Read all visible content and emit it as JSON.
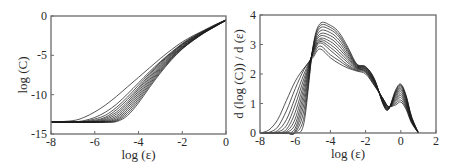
{
  "chart_data": [
    {
      "id": "left",
      "type": "line",
      "title": "",
      "xlabel": "log (ε)",
      "ylabel": "log (C)",
      "xlim": [
        -8,
        0
      ],
      "ylim": [
        -15,
        0
      ],
      "xticks": [
        -8,
        -6,
        -4,
        -2,
        0
      ],
      "yticks": [
        0,
        -5,
        -10,
        -15
      ],
      "grid": false,
      "legend": null,
      "frame_px": {
        "x0": 51,
        "y0": 16,
        "x1": 226,
        "y1": 134
      },
      "series_count": 12,
      "description": "Family of correlation-integral curves; each starts at a plateau near log(C)≈-13.5 for small ε, rises roughly linearly between log(ε)≈-6 and -2, and saturates towards ≈-0.5 at log(ε)=0.",
      "series": [
        {
          "name": "curve 1",
          "x": [
            -8,
            -7,
            -6.5,
            -6,
            -5.5,
            -5,
            -4.5,
            -4,
            -3.5,
            -3,
            -2.5,
            -2,
            -1.5,
            -1,
            -0.5,
            0
          ],
          "y": [
            -13.5,
            -13.3,
            -12.9,
            -12.2,
            -11.3,
            -10.2,
            -9.0,
            -7.8,
            -6.6,
            -5.4,
            -4.3,
            -3.3,
            -2.5,
            -1.8,
            -1.1,
            -0.5
          ]
        },
        {
          "name": "curve 2",
          "x": [
            -8,
            -7,
            -6.5,
            -6,
            -5.5,
            -5,
            -4.5,
            -4,
            -3.5,
            -3,
            -2.5,
            -2,
            -1.5,
            -1,
            -0.5,
            0
          ],
          "y": [
            -13.5,
            -13.45,
            -13.3,
            -12.9,
            -12.2,
            -11.2,
            -9.9,
            -8.5,
            -7.1,
            -5.8,
            -4.6,
            -3.5,
            -2.6,
            -1.9,
            -1.2,
            -0.5
          ]
        },
        {
          "name": "curve 3",
          "x": [
            -8,
            -7,
            -6.5,
            -6,
            -5.5,
            -5,
            -4.5,
            -4,
            -3.5,
            -3,
            -2.5,
            -2,
            -1.5,
            -1,
            -0.5,
            0
          ],
          "y": [
            -13.5,
            -13.5,
            -13.4,
            -13.1,
            -12.6,
            -11.6,
            -10.3,
            -8.8,
            -7.3,
            -5.9,
            -4.7,
            -3.6,
            -2.7,
            -1.9,
            -1.2,
            -0.5
          ]
        },
        {
          "name": "curve 4",
          "x": [
            -8,
            -7,
            -6.5,
            -6,
            -5.5,
            -5,
            -4.5,
            -4,
            -3.5,
            -3,
            -2.5,
            -2,
            -1.5,
            -1,
            -0.5,
            0
          ],
          "y": [
            -13.5,
            -13.5,
            -13.45,
            -13.25,
            -12.85,
            -11.9,
            -10.6,
            -9.1,
            -7.5,
            -6.0,
            -4.8,
            -3.6,
            -2.7,
            -1.9,
            -1.2,
            -0.5
          ]
        },
        {
          "name": "curve 5",
          "x": [
            -8,
            -7,
            -6.5,
            -6,
            -5.5,
            -5,
            -4.5,
            -4,
            -3.5,
            -3,
            -2.5,
            -2,
            -1.5,
            -1,
            -0.5,
            0
          ],
          "y": [
            -13.5,
            -13.5,
            -13.5,
            -13.35,
            -13.0,
            -12.2,
            -10.9,
            -9.3,
            -7.7,
            -6.2,
            -4.9,
            -3.7,
            -2.8,
            -2.0,
            -1.2,
            -0.5
          ]
        },
        {
          "name": "curve 6",
          "x": [
            -8,
            -7,
            -6.5,
            -6,
            -5.5,
            -5,
            -4.5,
            -4,
            -3.5,
            -3,
            -2.5,
            -2,
            -1.5,
            -1,
            -0.5,
            0
          ],
          "y": [
            -13.5,
            -13.5,
            -13.5,
            -13.42,
            -13.15,
            -12.45,
            -11.15,
            -9.55,
            -7.9,
            -6.35,
            -5.0,
            -3.8,
            -2.85,
            -2.0,
            -1.25,
            -0.5
          ]
        },
        {
          "name": "curve 7",
          "x": [
            -8,
            -7,
            -6.5,
            -6,
            -5.5,
            -5,
            -4.5,
            -4,
            -3.5,
            -3,
            -2.5,
            -2,
            -1.5,
            -1,
            -0.5,
            0
          ],
          "y": [
            -13.5,
            -13.5,
            -13.5,
            -13.47,
            -13.27,
            -12.7,
            -11.4,
            -9.8,
            -8.1,
            -6.5,
            -5.1,
            -3.9,
            -2.9,
            -2.05,
            -1.25,
            -0.5
          ]
        },
        {
          "name": "curve 8",
          "x": [
            -8,
            -7,
            -6.5,
            -6,
            -5.5,
            -5,
            -4.5,
            -4,
            -3.5,
            -3,
            -2.5,
            -2,
            -1.5,
            -1,
            -0.5,
            0
          ],
          "y": [
            -13.5,
            -13.5,
            -13.5,
            -13.5,
            -13.37,
            -12.9,
            -11.65,
            -10.05,
            -8.3,
            -6.65,
            -5.2,
            -3.95,
            -2.95,
            -2.05,
            -1.3,
            -0.55
          ]
        },
        {
          "name": "curve 9",
          "x": [
            -8,
            -7,
            -6.5,
            -6,
            -5.5,
            -5,
            -4.5,
            -4,
            -3.5,
            -3,
            -2.5,
            -2,
            -1.5,
            -1,
            -0.5,
            0
          ],
          "y": [
            -13.5,
            -13.5,
            -13.5,
            -13.5,
            -13.43,
            -13.08,
            -11.9,
            -10.3,
            -8.5,
            -6.8,
            -5.3,
            -4.0,
            -3.0,
            -2.1,
            -1.3,
            -0.55
          ]
        },
        {
          "name": "curve 10",
          "x": [
            -8,
            -7,
            -6.5,
            -6,
            -5.5,
            -5,
            -4.5,
            -4,
            -3.5,
            -3,
            -2.5,
            -2,
            -1.5,
            -1,
            -0.5,
            0
          ],
          "y": [
            -13.5,
            -13.5,
            -13.5,
            -13.5,
            -13.47,
            -13.22,
            -12.15,
            -10.55,
            -8.7,
            -6.95,
            -5.4,
            -4.1,
            -3.05,
            -2.1,
            -1.3,
            -0.55
          ]
        },
        {
          "name": "curve 11",
          "x": [
            -8,
            -7,
            -6.5,
            -6,
            -5.5,
            -5,
            -4.5,
            -4,
            -3.5,
            -3,
            -2.5,
            -2,
            -1.5,
            -1,
            -0.5,
            0
          ],
          "y": [
            -13.5,
            -13.5,
            -13.5,
            -13.5,
            -13.5,
            -13.33,
            -12.4,
            -10.8,
            -8.9,
            -7.1,
            -5.5,
            -4.15,
            -3.1,
            -2.15,
            -1.35,
            -0.55
          ]
        },
        {
          "name": "curve 12",
          "x": [
            -8,
            -7,
            -6.5,
            -6,
            -5.5,
            -5,
            -4.5,
            -4,
            -3.5,
            -3,
            -2.5,
            -2,
            -1.5,
            -1,
            -0.5,
            0
          ],
          "y": [
            -13.5,
            -13.5,
            -13.5,
            -13.5,
            -13.5,
            -13.42,
            -12.65,
            -11.05,
            -9.1,
            -7.25,
            -5.6,
            -4.2,
            -3.1,
            -2.15,
            -1.35,
            -0.55
          ]
        }
      ]
    },
    {
      "id": "right",
      "type": "line",
      "title": "",
      "xlabel": "log (ε)",
      "ylabel": "d (log (C)) / d (ε)",
      "xlim": [
        -8,
        2
      ],
      "ylim": [
        0,
        4
      ],
      "xticks": [
        -8,
        -6,
        -4,
        -2,
        0,
        2
      ],
      "yticks": [
        0,
        1,
        2,
        3,
        4
      ],
      "grid": false,
      "legend": null,
      "frame_px": {
        "x0": 260,
        "y0": 15,
        "x1": 436,
        "y1": 133
      },
      "series_count": 12,
      "description": "Local slopes of the left curves: onset between log(ε)≈-7.5 and -5.8, main peak of ≈2.9–3.7 near log(ε)≈-4.6, shoulder ≈2.0–2.25 near -2, dip ≈0.8–0.95 near -0.7, secondary peak ≈1.05–1.65 near 0, falling to 0 by ≈1.",
      "series": [
        {
          "name": "curve 1",
          "x": [
            -8,
            -7.5,
            -7,
            -6.5,
            -6,
            -5.5,
            -5,
            -4.6,
            -4,
            -3.5,
            -3,
            -2.5,
            -2,
            -1.5,
            -1,
            -0.7,
            -0.3,
            0,
            0.3,
            0.6,
            1.0
          ],
          "y": [
            0,
            0.1,
            0.45,
            1.1,
            1.75,
            2.2,
            2.55,
            2.85,
            2.55,
            2.35,
            2.2,
            2.1,
            2.0,
            1.6,
            1.15,
            0.9,
            0.95,
            1.05,
            0.8,
            0.35,
            0
          ]
        },
        {
          "name": "curve 2",
          "x": [
            -8,
            -7.5,
            -7,
            -6.5,
            -6,
            -5.5,
            -5,
            -4.6,
            -4,
            -3.5,
            -3,
            -2.5,
            -2,
            -1.5,
            -1,
            -0.7,
            -0.3,
            0,
            0.3,
            0.6,
            1.0
          ],
          "y": [
            0,
            0.02,
            0.2,
            0.75,
            1.5,
            2.15,
            2.6,
            2.95,
            2.65,
            2.45,
            2.25,
            2.12,
            2.05,
            1.62,
            1.15,
            0.9,
            1.0,
            1.12,
            0.85,
            0.38,
            0
          ]
        },
        {
          "name": "curve 3",
          "x": [
            -8,
            -7.5,
            -7,
            -6.5,
            -6,
            -5.5,
            -5,
            -4.6,
            -4,
            -3.5,
            -3,
            -2.5,
            -2,
            -1.5,
            -1,
            -0.7,
            -0.3,
            0,
            0.3,
            0.6,
            1.0
          ],
          "y": [
            0,
            0,
            0.08,
            0.45,
            1.2,
            2.0,
            2.65,
            3.05,
            2.8,
            2.55,
            2.3,
            2.15,
            2.08,
            1.65,
            1.15,
            0.88,
            1.05,
            1.2,
            0.9,
            0.4,
            0
          ]
        },
        {
          "name": "curve 4",
          "x": [
            -8,
            -7.5,
            -7,
            -6.5,
            -6,
            -5.5,
            -5,
            -4.6,
            -4,
            -3.5,
            -3,
            -2.5,
            -2,
            -1.5,
            -1,
            -0.7,
            -0.3,
            0,
            0.3,
            0.6,
            1.0
          ],
          "y": [
            0,
            0,
            0.03,
            0.25,
            0.95,
            1.85,
            2.7,
            3.1,
            2.9,
            2.65,
            2.38,
            2.18,
            2.1,
            1.68,
            1.12,
            0.87,
            1.1,
            1.27,
            0.95,
            0.42,
            0
          ]
        },
        {
          "name": "curve 5",
          "x": [
            -8,
            -7.5,
            -7,
            -6.5,
            -6,
            -5.5,
            -5,
            -4.6,
            -4,
            -3.5,
            -3,
            -2.5,
            -2,
            -1.5,
            -1,
            -0.7,
            -0.3,
            0,
            0.3,
            0.6,
            1.0
          ],
          "y": [
            0,
            0,
            0,
            0.12,
            0.7,
            1.7,
            2.72,
            3.15,
            3.0,
            2.75,
            2.45,
            2.2,
            2.12,
            1.7,
            1.1,
            0.86,
            1.15,
            1.33,
            1.0,
            0.44,
            0
          ]
        },
        {
          "name": "curve 6",
          "x": [
            -8,
            -7.5,
            -7,
            -6.5,
            -6,
            -5.5,
            -5,
            -4.6,
            -4,
            -3.5,
            -3,
            -2.5,
            -2,
            -1.5,
            -1,
            -0.7,
            -0.3,
            0,
            0.3,
            0.6,
            1.0
          ],
          "y": [
            0,
            0,
            0,
            0.05,
            0.48,
            1.55,
            2.75,
            3.2,
            3.1,
            2.85,
            2.52,
            2.22,
            2.15,
            1.72,
            1.08,
            0.85,
            1.2,
            1.4,
            1.05,
            0.46,
            0
          ]
        },
        {
          "name": "curve 7",
          "x": [
            -8,
            -7.5,
            -7,
            -6.5,
            -6,
            -5.5,
            -5,
            -4.6,
            -4,
            -3.5,
            -3,
            -2.5,
            -2,
            -1.5,
            -1,
            -0.7,
            -0.3,
            0,
            0.3,
            0.6,
            1.0
          ],
          "y": [
            0,
            0,
            0,
            0.02,
            0.3,
            1.38,
            2.78,
            3.28,
            3.2,
            2.95,
            2.58,
            2.24,
            2.17,
            1.74,
            1.06,
            0.84,
            1.25,
            1.46,
            1.1,
            0.48,
            0
          ]
        },
        {
          "name": "curve 8",
          "x": [
            -8,
            -7.5,
            -7,
            -6.5,
            -6,
            -5.5,
            -5,
            -4.6,
            -4,
            -3.5,
            -3,
            -2.5,
            -2,
            -1.5,
            -1,
            -0.7,
            -0.3,
            0,
            0.3,
            0.6,
            1.0
          ],
          "y": [
            0,
            0,
            0,
            0,
            0.16,
            1.2,
            2.8,
            3.35,
            3.3,
            3.05,
            2.65,
            2.26,
            2.19,
            1.76,
            1.04,
            0.83,
            1.3,
            1.51,
            1.14,
            0.5,
            0
          ]
        },
        {
          "name": "curve 9",
          "x": [
            -8,
            -7.5,
            -7,
            -6.5,
            -6,
            -5.5,
            -5,
            -4.6,
            -4,
            -3.5,
            -3,
            -2.5,
            -2,
            -1.5,
            -1,
            -0.7,
            -0.3,
            0,
            0.3,
            0.6,
            1.0
          ],
          "y": [
            0,
            0,
            0,
            0,
            0.07,
            1.0,
            2.82,
            3.45,
            3.4,
            3.15,
            2.72,
            2.28,
            2.21,
            1.78,
            1.02,
            0.82,
            1.34,
            1.56,
            1.18,
            0.52,
            0
          ]
        },
        {
          "name": "curve 10",
          "x": [
            -8,
            -7.5,
            -7,
            -6.5,
            -6,
            -5.5,
            -5,
            -4.6,
            -4,
            -3.5,
            -3,
            -2.5,
            -2,
            -1.5,
            -1,
            -0.7,
            -0.3,
            0,
            0.3,
            0.6,
            1.0
          ],
          "y": [
            0,
            0,
            0,
            0,
            0.02,
            0.78,
            2.84,
            3.55,
            3.5,
            3.25,
            2.78,
            2.3,
            2.23,
            1.8,
            1.0,
            0.81,
            1.38,
            1.6,
            1.22,
            0.54,
            0
          ]
        },
        {
          "name": "curve 11",
          "x": [
            -8,
            -7.5,
            -7,
            -6.5,
            -6,
            -5.5,
            -5,
            -4.6,
            -4,
            -3.5,
            -3,
            -2.5,
            -2,
            -1.5,
            -1,
            -0.7,
            -0.3,
            0,
            0.3,
            0.6,
            1.0
          ],
          "y": [
            0,
            0,
            0,
            0,
            0,
            0.55,
            2.86,
            3.63,
            3.58,
            3.32,
            2.84,
            2.32,
            2.24,
            1.82,
            0.98,
            0.8,
            1.42,
            1.63,
            1.25,
            0.56,
            0
          ]
        },
        {
          "name": "curve 12",
          "x": [
            -8,
            -7.5,
            -7,
            -6.5,
            -6,
            -5.5,
            -5,
            -4.6,
            -4,
            -3.5,
            -3,
            -2.5,
            -2,
            -1.5,
            -1,
            -0.7,
            -0.3,
            0,
            0.3,
            0.6,
            1.0
          ],
          "y": [
            0,
            0,
            0,
            0,
            0,
            0.35,
            2.88,
            3.7,
            3.65,
            3.4,
            2.9,
            2.34,
            2.25,
            1.84,
            0.96,
            0.8,
            1.45,
            1.66,
            1.28,
            0.58,
            0
          ]
        }
      ]
    }
  ]
}
